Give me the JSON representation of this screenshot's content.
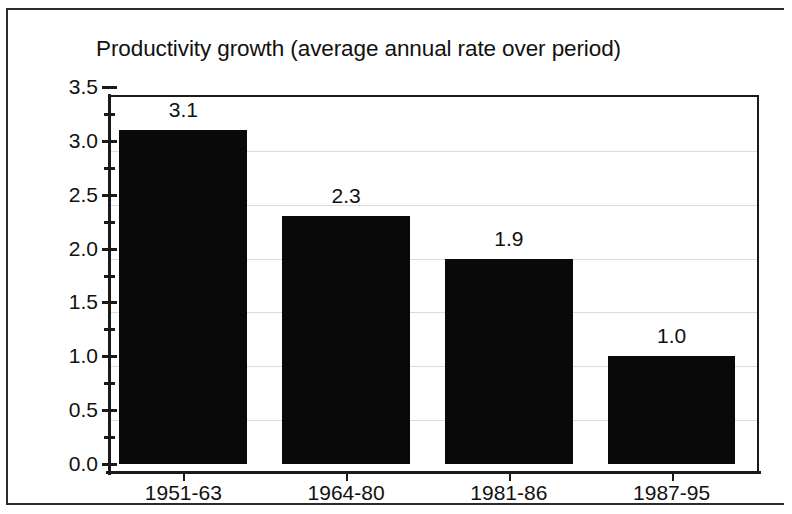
{
  "chart_data": {
    "type": "bar",
    "title": "Productivity growth (average annual rate over period)",
    "categories": [
      "1951-63",
      "1964-80",
      "1981-86",
      "1987-95"
    ],
    "values": [
      3.1,
      2.3,
      1.9,
      1.0
    ],
    "value_labels": [
      "3.1",
      "2.3",
      "1.9",
      "1.0"
    ],
    "xlabel": "",
    "ylabel": "",
    "ylim": [
      0.0,
      3.5
    ],
    "ytick_labels": [
      "0.0",
      "0.5",
      "1.0",
      "1.5",
      "2.0",
      "2.5",
      "3.0",
      "3.5"
    ],
    "ytick_values": [
      0.0,
      0.5,
      1.0,
      1.5,
      2.0,
      2.5,
      3.0,
      3.5
    ],
    "yminor_values": [
      0.25,
      0.75,
      1.25,
      1.75,
      2.25,
      2.75,
      3.25
    ],
    "grid": true,
    "grid_axis": "y",
    "legend": false,
    "legend_position": "none",
    "bar_color": "#090909",
    "grid_color": "#dcdcdc",
    "axis_color": "#1a1a1a",
    "text_color": "#111111",
    "background_color": "#ffffff"
  }
}
